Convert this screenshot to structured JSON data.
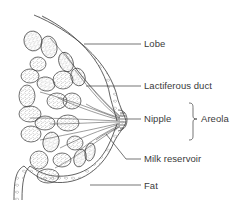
{
  "diagram": {
    "colors": {
      "stroke": "#3a3a3a",
      "text": "#3a3a3a",
      "background": "#ffffff"
    },
    "labels": [
      {
        "id": "lobe",
        "text": "Lobe",
        "x": 144,
        "y": 38
      },
      {
        "id": "lactiferous-duct",
        "text": "Lactiferous duct",
        "x": 144,
        "y": 80
      },
      {
        "id": "nipple",
        "text": "Nipple",
        "x": 144,
        "y": 113
      },
      {
        "id": "areola",
        "text": "Areola",
        "x": 201,
        "y": 113
      },
      {
        "id": "milk-reservoir",
        "text": "Milk reservoir",
        "x": 144,
        "y": 153
      },
      {
        "id": "fat",
        "text": "Fat",
        "x": 144,
        "y": 180
      }
    ]
  }
}
